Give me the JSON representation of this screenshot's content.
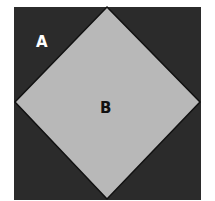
{
  "diagram": {
    "outer_square": {
      "label": "A",
      "fill": "#2b2b2b"
    },
    "inner_diamond": {
      "label": "B",
      "fill": "#b8b8b8",
      "stroke": "#111111"
    }
  }
}
